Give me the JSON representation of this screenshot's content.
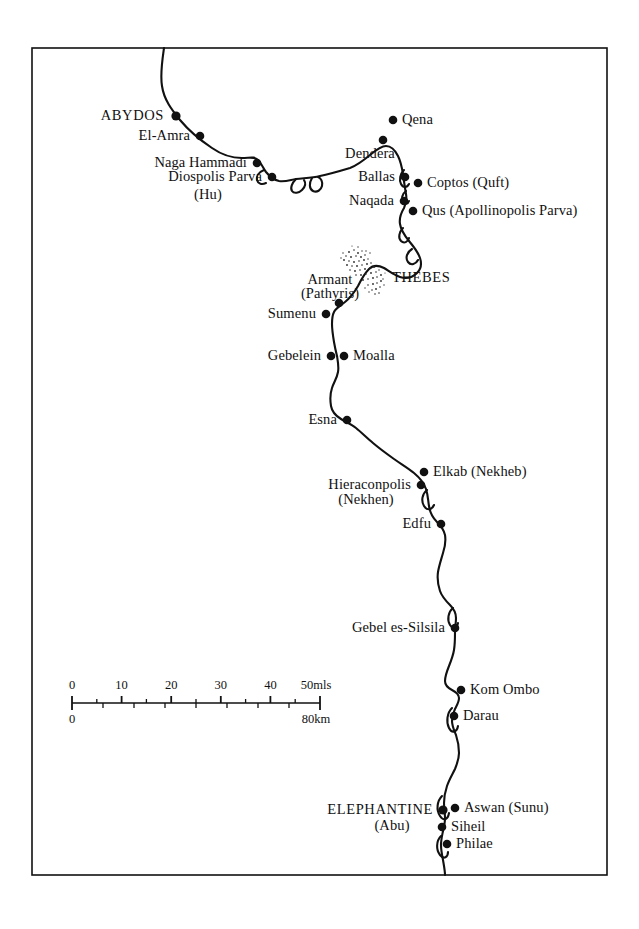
{
  "map": {
    "title": "Nile Valley archaeological sites map",
    "background_color": "#ffffff",
    "ink_color": "#111111",
    "frame": {
      "x": 32,
      "y": 48,
      "width": 575,
      "height": 827
    },
    "river": {
      "name": "Nile",
      "stroke_color": "#111111",
      "stroke_width": 2.1
    },
    "sites": [
      {
        "id": "abydos",
        "label": "ABYDOS",
        "style": "major",
        "align": "right",
        "dot": [
          176,
          116
        ],
        "text": [
          164,
          116
        ]
      },
      {
        "id": "el-amra",
        "label": "El-Amra",
        "style": "minor",
        "align": "right",
        "dot": [
          200,
          136
        ],
        "text": [
          190,
          136
        ]
      },
      {
        "id": "naga-hammadi",
        "label": "Naga Hammadi",
        "style": "minor",
        "align": "right",
        "dot": [
          257,
          163
        ],
        "text": [
          247,
          163
        ]
      },
      {
        "id": "diospolis-parva",
        "label": "Diospolis Parva",
        "style": "minor",
        "align": "right",
        "dot": [
          272,
          177
        ],
        "text": [
          262,
          177
        ]
      },
      {
        "id": "hu",
        "label": "(Hu)",
        "style": "minor",
        "align": "center",
        "dot": null,
        "text": [
          208,
          195
        ]
      },
      {
        "id": "qena",
        "label": "Qena",
        "style": "minor",
        "align": "left",
        "dot": [
          393,
          120
        ],
        "text": [
          402,
          120
        ]
      },
      {
        "id": "dendera",
        "label": "Dendera",
        "style": "minor",
        "align": "center",
        "dot": [
          383,
          140
        ],
        "text": [
          370,
          154
        ]
      },
      {
        "id": "ballas",
        "label": "Ballas",
        "style": "minor",
        "align": "right",
        "dot": [
          405,
          177
        ],
        "text": [
          395,
          177
        ]
      },
      {
        "id": "coptos",
        "label": "Coptos  (Quft)",
        "style": "minor",
        "align": "left",
        "dot": [
          418,
          183
        ],
        "text": [
          427,
          183
        ]
      },
      {
        "id": "naqada",
        "label": "Naqada",
        "style": "minor",
        "align": "right",
        "dot": [
          404,
          201
        ],
        "text": [
          394,
          201
        ]
      },
      {
        "id": "qus",
        "label": "Qus (Apollinopolis Parva)",
        "style": "minor",
        "align": "left",
        "dot": [
          413,
          211
        ],
        "text": [
          422,
          211
        ]
      },
      {
        "id": "thebes",
        "label": "THEBES",
        "style": "major",
        "align": "left",
        "dot": null,
        "text": [
          392,
          278
        ]
      },
      {
        "id": "armant",
        "label": "Armant",
        "style": "minor",
        "align": "center",
        "dot": [
          339,
          303
        ],
        "text": [
          330,
          280
        ]
      },
      {
        "id": "pathyris",
        "label": "(Pathyris)",
        "style": "minor",
        "align": "center",
        "dot": null,
        "text": [
          330,
          294
        ]
      },
      {
        "id": "sumenu",
        "label": "Sumenu",
        "style": "minor",
        "align": "right",
        "dot": [
          326,
          314
        ],
        "text": [
          316,
          314
        ]
      },
      {
        "id": "gebelein",
        "label": "Gebelein",
        "style": "minor",
        "align": "right",
        "dot": [
          331,
          356
        ],
        "text": [
          321,
          356
        ]
      },
      {
        "id": "moalla",
        "label": "Moalla",
        "style": "minor",
        "align": "left",
        "dot": [
          344,
          356
        ],
        "text": [
          353,
          356
        ]
      },
      {
        "id": "esna",
        "label": "Esna",
        "style": "minor",
        "align": "right",
        "dot": [
          347,
          420
        ],
        "text": [
          337,
          420
        ]
      },
      {
        "id": "elkab",
        "label": "Elkab  (Nekheb)",
        "style": "minor",
        "align": "left",
        "dot": [
          424,
          472
        ],
        "text": [
          433,
          472
        ]
      },
      {
        "id": "hieraconpolis",
        "label": "Hieraconpolis",
        "style": "minor",
        "align": "right",
        "dot": [
          421,
          485
        ],
        "text": [
          411,
          485
        ]
      },
      {
        "id": "nekhen",
        "label": "(Nekhen)",
        "style": "minor",
        "align": "center",
        "dot": null,
        "text": [
          366,
          500
        ]
      },
      {
        "id": "edfu",
        "label": "Edfu",
        "style": "minor",
        "align": "right",
        "dot": [
          441,
          524
        ],
        "text": [
          431,
          524
        ]
      },
      {
        "id": "gebel-es-silsila",
        "label": "Gebel es-Silsila",
        "style": "minor",
        "align": "right",
        "dot": [
          455,
          628
        ],
        "text": [
          445,
          628
        ]
      },
      {
        "id": "kom-ombo",
        "label": "Kom Ombo",
        "style": "minor",
        "align": "left",
        "dot": [
          461,
          690
        ],
        "text": [
          470,
          690
        ]
      },
      {
        "id": "darau",
        "label": "Darau",
        "style": "minor",
        "align": "left",
        "dot": [
          454,
          716
        ],
        "text": [
          463,
          716
        ]
      },
      {
        "id": "elephantine",
        "label": "ELEPHANTINE",
        "style": "major",
        "align": "right",
        "dot": [
          443,
          810
        ],
        "text": [
          433,
          810
        ]
      },
      {
        "id": "abu",
        "label": "(Abu)",
        "style": "minor",
        "align": "center",
        "dot": null,
        "text": [
          392,
          826
        ]
      },
      {
        "id": "aswan",
        "label": "Aswan  (Sunu)",
        "style": "minor",
        "align": "left",
        "dot": [
          455,
          808
        ],
        "text": [
          464,
          808
        ]
      },
      {
        "id": "siheil",
        "label": "Siheil",
        "style": "minor",
        "align": "left",
        "dot": [
          442,
          827
        ],
        "text": [
          451,
          827
        ]
      },
      {
        "id": "philae",
        "label": "Philae",
        "style": "minor",
        "align": "left",
        "dot": [
          447,
          844
        ],
        "text": [
          456,
          844
        ]
      }
    ],
    "scale_bar": {
      "x": 72,
      "y": 703,
      "length": 248,
      "miles": {
        "unit_label": "50mls",
        "tick_labels": [
          "0",
          "10",
          "20",
          "30",
          "40"
        ],
        "tick_values": [
          0,
          10,
          20,
          30,
          40,
          50
        ],
        "max": 50
      },
      "kilometers": {
        "unit_label": "80km",
        "start_label": "0",
        "tick_values": [
          0,
          10,
          20,
          30,
          40,
          50,
          60,
          70,
          80
        ],
        "max": 80
      }
    },
    "thebes_hatch": {
      "name": "thebes-necropolis-stipple",
      "description": "stippled diagonal band marking the Theban area"
    }
  }
}
